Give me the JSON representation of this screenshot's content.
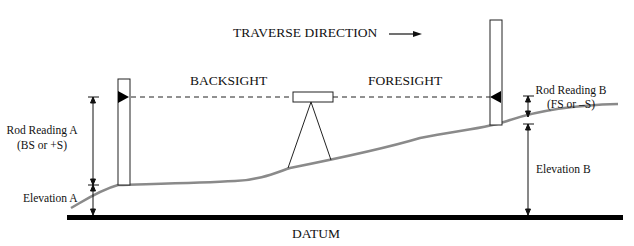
{
  "labels": {
    "traverse_direction": "TRAVERSE DIRECTION",
    "backsight": "BACKSIGHT",
    "foresight": "FORESIGHT",
    "rod_reading_a_line1": "Rod Reading A",
    "rod_reading_a_line2": "(BS or +S)",
    "elevation_a": "Elevation A",
    "rod_reading_b_line1": "Rod Reading B",
    "rod_reading_b_line2": "(FS or –S)",
    "elevation_b": "Elevation B",
    "datum": "DATUM"
  },
  "colors": {
    "ground": "#8a8a8a",
    "ink": "#111111",
    "datum": "#000000"
  }
}
